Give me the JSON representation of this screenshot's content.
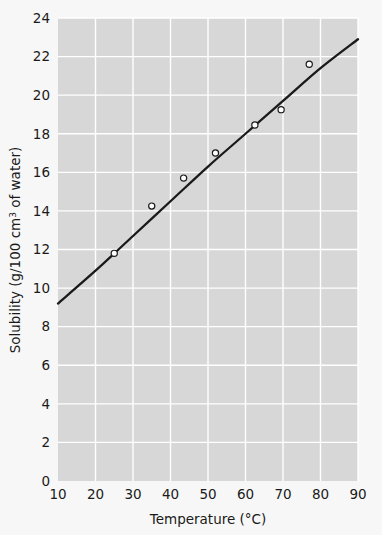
{
  "figure": {
    "background_color": "#f7f7f7",
    "plot_background_color": "#d7d7d7",
    "grid_color": "#ffffff",
    "line_color": "#1a1a1a",
    "marker_face_color": "#ffffff",
    "marker_edge_color": "#1a1a1a"
  },
  "chart_data": {
    "type": "scatter",
    "title": "",
    "subtitle": "",
    "xlabel": "Temperature (°C)",
    "ylabel": "Solubility (g/100 cm3 of water)",
    "ylabel_parts": {
      "prefix": "Solubility (g/100 cm",
      "superscript": "3",
      "suffix": " of water)"
    },
    "xlim": [
      10,
      90
    ],
    "ylim": [
      0,
      24
    ],
    "xticks": [
      10,
      20,
      30,
      40,
      50,
      60,
      70,
      80,
      90
    ],
    "xtick_labels": [
      "10",
      "20",
      "30",
      "40",
      "50",
      "60",
      "70",
      "80",
      "90"
    ],
    "yticks": [
      0,
      2,
      4,
      6,
      8,
      10,
      12,
      14,
      16,
      18,
      20,
      22,
      24
    ],
    "ytick_labels": [
      "0",
      "2",
      "4",
      "6",
      "8",
      "10",
      "12",
      "14",
      "16",
      "18",
      "20",
      "22",
      "24"
    ],
    "grid": true,
    "legend": null,
    "legend_position": "none",
    "series": [
      {
        "name": "Measured solubility",
        "type": "scatter",
        "marker": "open-circle",
        "points": [
          {
            "x": 25.0,
            "y": 11.8
          },
          {
            "x": 35.0,
            "y": 14.25
          },
          {
            "x": 43.5,
            "y": 15.7
          },
          {
            "x": 52.0,
            "y": 17.0
          },
          {
            "x": 62.5,
            "y": 18.45
          },
          {
            "x": 69.5,
            "y": 19.25
          },
          {
            "x": 77.0,
            "y": 21.6
          }
        ]
      },
      {
        "name": "Best-fit curve",
        "type": "line",
        "points": [
          {
            "x": 10.0,
            "y": 9.2
          },
          {
            "x": 20.0,
            "y": 10.9
          },
          {
            "x": 30.0,
            "y": 12.7
          },
          {
            "x": 40.0,
            "y": 14.5
          },
          {
            "x": 50.0,
            "y": 16.3
          },
          {
            "x": 60.0,
            "y": 18.0
          },
          {
            "x": 70.0,
            "y": 19.7
          },
          {
            "x": 80.0,
            "y": 21.4
          },
          {
            "x": 90.0,
            "y": 22.9
          }
        ]
      }
    ]
  }
}
